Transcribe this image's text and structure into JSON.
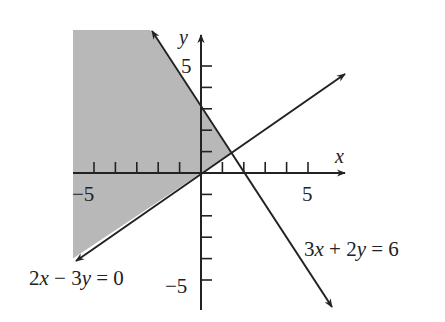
{
  "figure": {
    "type": "linear-inequality-graph",
    "shade_color": "#b8b8b8",
    "line_color": "#222222",
    "axes": {
      "x_label": "x",
      "y_label": "y",
      "x_tick_label_neg": "−5",
      "x_tick_label_pos": "5",
      "y_tick_label_pos": "5",
      "y_tick_label_neg": "−5",
      "tick_step": 1,
      "x_range": [
        -6,
        6.7
      ],
      "y_range": [
        -6.3,
        6.5
      ]
    },
    "lines": [
      {
        "label": "3x + 2y = 6",
        "label_parts": [
          "3",
          "x",
          " + 2",
          "y",
          " = 6"
        ]
      },
      {
        "label": "2x − 3y = 0",
        "label_parts": [
          "2",
          "x",
          " − 3",
          "y",
          " = 0"
        ]
      }
    ],
    "shaded_region": "x ≥ −6, 3x + 2y ≤ 6, 2x − 3y ≤ 0"
  }
}
